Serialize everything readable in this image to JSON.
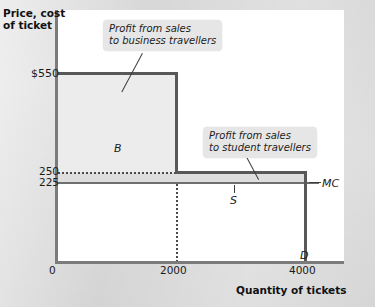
{
  "chart_data": {
    "type": "line",
    "title": "",
    "xlabel": "Quantity of tickets",
    "ylabel": "Price, cost of ticket",
    "xlim": [
      0,
      4400
    ],
    "ylim": [
      0,
      640
    ],
    "grid": false,
    "legend_position": "none",
    "x_ticks": [
      "0",
      "2000",
      "4000"
    ],
    "y_ticks": [
      "$550",
      "250",
      "225"
    ],
    "series": [
      {
        "name": "D",
        "label": "D",
        "type": "step",
        "points": [
          {
            "x": 0,
            "y": 550
          },
          {
            "x": 2000,
            "y": 550
          },
          {
            "x": 2000,
            "y": 250
          },
          {
            "x": 4000,
            "y": 250
          },
          {
            "x": 4000,
            "y": 0
          }
        ]
      },
      {
        "name": "MC",
        "label": "MC",
        "type": "line",
        "points": [
          {
            "x": 0,
            "y": 225
          },
          {
            "x": 4400,
            "y": 225
          }
        ]
      }
    ],
    "shaded_regions": [
      {
        "name": "B",
        "label": "B",
        "description": "Profit from sales to business travellers",
        "x_range": [
          0,
          2000
        ],
        "y_range": [
          250,
          550
        ]
      },
      {
        "name": "S",
        "label": "S",
        "description": "Profit from sales to student travellers",
        "x_range": [
          0,
          4000
        ],
        "y_range": [
          225,
          250
        ]
      }
    ],
    "annotations": [
      "Profit from sales to business travellers",
      "Profit from sales to student travellers"
    ]
  },
  "axes": {
    "y_title_line1": "Price, cost",
    "y_title_line2": "of ticket",
    "x_title": "Quantity of tickets",
    "y_ticks": {
      "t550": "$550",
      "t250": "250",
      "t225": "225"
    },
    "x_ticks": {
      "t0": "0",
      "t2000": "2000",
      "t4000": "4000"
    }
  },
  "labels": {
    "region_b": "B",
    "region_s": "S",
    "curve_mc": "MC",
    "curve_d": "D"
  },
  "callouts": {
    "business": {
      "line1": "Profit from sales",
      "line2": "to business travellers"
    },
    "student": {
      "line1": "Profit from sales",
      "line2": "to student travellers"
    }
  },
  "colors": {
    "page_background": "#dcdcdc",
    "plot_background": "#ffffff",
    "axis": "#7b7b7b",
    "demand_curve": "#585858",
    "mc_curve": "#6e6e6e",
    "area_b": "#ececed",
    "area_s": "#dedede",
    "callout_background": "#e6e6e6",
    "text": "#1a1a1a"
  }
}
